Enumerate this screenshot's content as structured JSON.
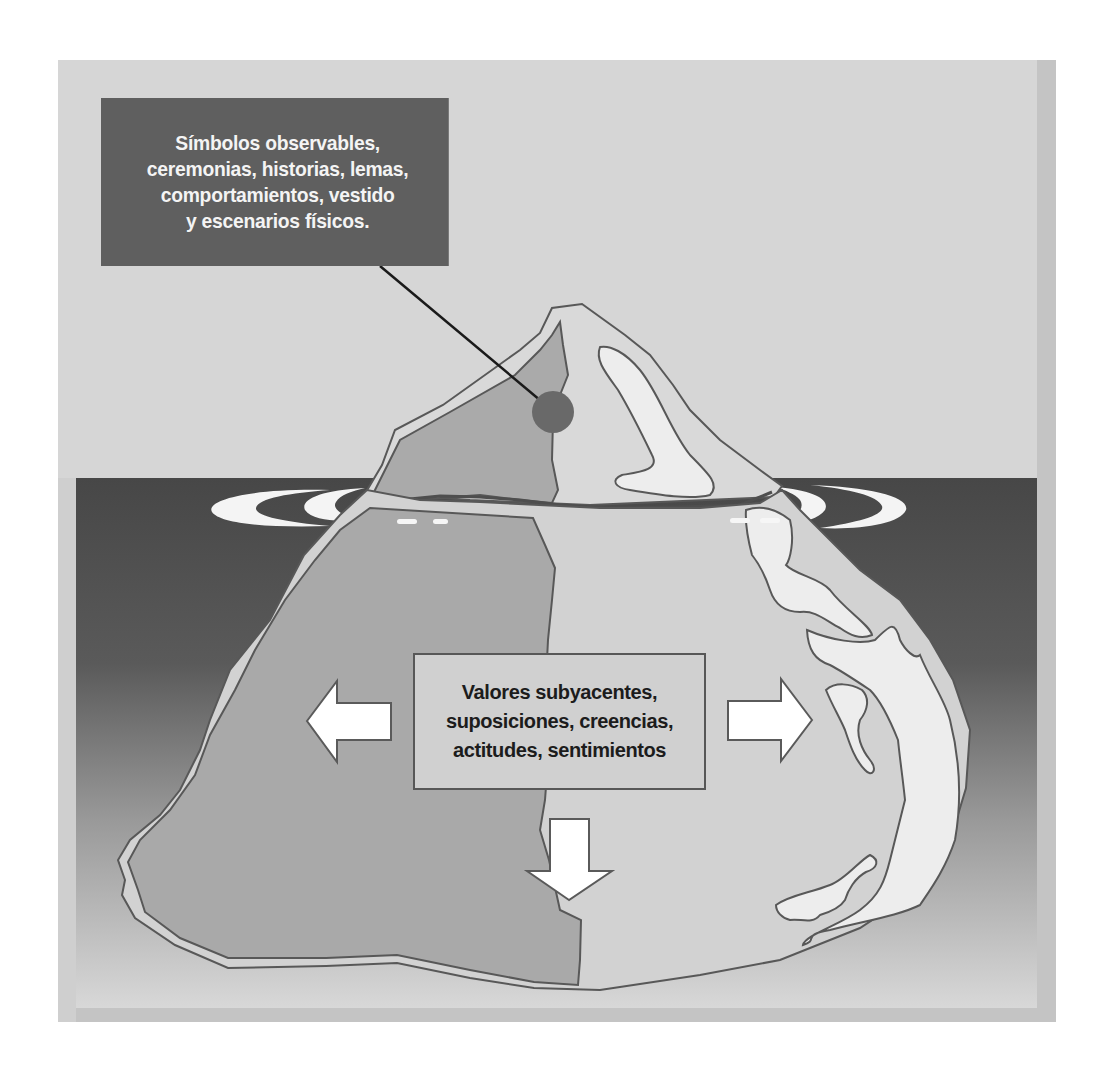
{
  "diagram": {
    "type": "iceberg",
    "above_water_callout": {
      "lines": [
        "Símbolos observables,",
        "ceremonias, historias, lemas,",
        "comportamientos, vestido",
        "y escenarios físicos."
      ]
    },
    "below_water_callout": {
      "lines": [
        "Valores subyacentes,",
        "suposiciones, creencias,",
        "actitudes, sentimientos"
      ]
    },
    "arrows": [
      "left",
      "right",
      "down"
    ],
    "colors": {
      "page_background": "#ffffff",
      "frame_outer": "#c2c2c2",
      "sky": "#d6d6d6",
      "water_top": "#4a4a4a",
      "water_bottom": "#d4d4d4",
      "iceberg_light": "#d4d4d4",
      "iceberg_dark": "#a9a9a9",
      "iceberg_highlight": "#ebebeb",
      "outline": "#585858",
      "top_callout_bg": "#5f5f5f",
      "marker_dot": "#6a6a6a"
    }
  }
}
